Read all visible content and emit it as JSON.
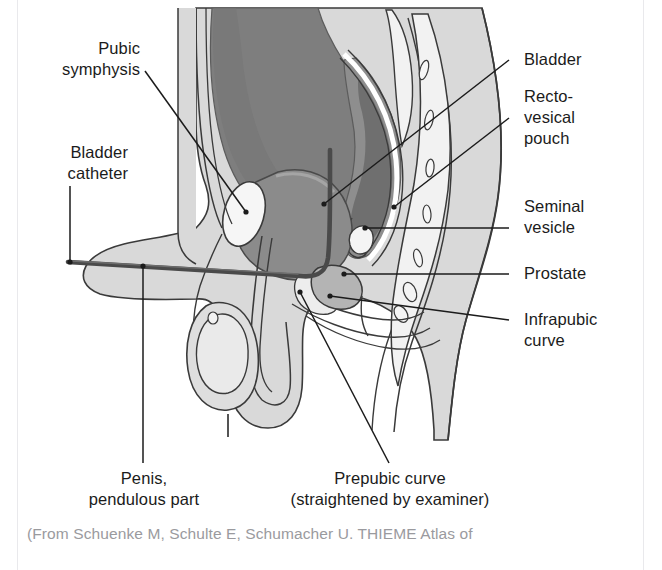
{
  "figure": {
    "colors": {
      "ink": "#1b1b1b",
      "outline": "#3a3a3a",
      "soft_tissue": "#d9d9d9",
      "bone_light": "#f2f2f2",
      "bladder": "#8e8e8e",
      "rectum": "#7e7e7e",
      "rectum_dark": "#6f6f6f",
      "muscle_mid": "#b4b4b4",
      "catheter": "#4a4a4a",
      "caption_gray": "#9a9a9e",
      "gutter_rule": "#e9e9ec",
      "page_background": "#ffffff"
    },
    "labels": [
      {
        "name": "pubic-symphysis",
        "text": "Pubic\nsymphysis",
        "side": "left"
      },
      {
        "name": "bladder-catheter",
        "text": "Bladder\ncatheter",
        "side": "left"
      },
      {
        "name": "bladder",
        "text": "Bladder",
        "side": "right"
      },
      {
        "name": "recto-vesical-pouch",
        "text": "Recto-\nvesical\npouch",
        "side": "right"
      },
      {
        "name": "seminal-vesicle",
        "text": "Seminal\nvesicle",
        "side": "right"
      },
      {
        "name": "prostate",
        "text": "Prostate",
        "side": "right"
      },
      {
        "name": "infrapubic-curve",
        "text": "Infrapubic\ncurve",
        "side": "right"
      },
      {
        "name": "penis-pendulous-part",
        "text": "Penis,\npendulous part",
        "side": "bottom"
      },
      {
        "name": "prepubic-curve",
        "text": "Prepubic curve\n(straightened by examiner)",
        "side": "bottom"
      }
    ],
    "caption": "(From Schuenke M, Schulte E, Schumacher U. THIEME Atlas of"
  }
}
